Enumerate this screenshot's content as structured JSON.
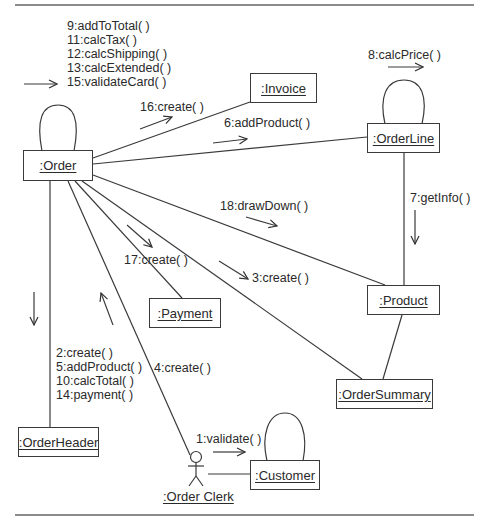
{
  "diagram": {
    "type": "UML communication diagram",
    "objects": {
      "order": ":Order",
      "invoice": ":Invoice",
      "orderline": ":OrderLine",
      "product": ":Product",
      "payment": ":Payment",
      "ordersummary": ":OrderSummary",
      "orderheader": ":OrderHeader",
      "customer": ":Customer",
      "orderclerk": ":Order Clerk"
    },
    "messages": {
      "order_self": [
        "9:addToTotal( )",
        "11:calcTax( )",
        "12:calcShipping( )",
        "13:calcExtended( )",
        "15:validateCard( )"
      ],
      "order_invoice": "16:create( )",
      "order_orderline": "6:addProduct( )",
      "orderline_self": "8:calcPrice( )",
      "orderline_product": "7:getInfo( )",
      "order_product": "18:drawDown( )",
      "order_payment": "17:create( )",
      "order_ordersummary": "3:create( )",
      "order_orderheader": [
        "2:create( )",
        "5:addProduct( )",
        "10:calcTotal( )",
        "14:payment( )"
      ],
      "clerk_order": "4:create( )",
      "clerk_customer": "1:validate( )"
    },
    "links": [
      [
        "order",
        "invoice"
      ],
      [
        "order",
        "orderline"
      ],
      [
        "order",
        "product"
      ],
      [
        "order",
        "payment"
      ],
      [
        "order",
        "ordersummary"
      ],
      [
        "order",
        "orderheader"
      ],
      [
        "order",
        "orderclerk"
      ],
      [
        "orderline",
        "product"
      ],
      [
        "product",
        "ordersummary"
      ],
      [
        "orderclerk",
        "customer"
      ]
    ],
    "colors": {
      "ink": "#2a2a2a",
      "rule": "#555555",
      "background": "#ffffff"
    }
  }
}
